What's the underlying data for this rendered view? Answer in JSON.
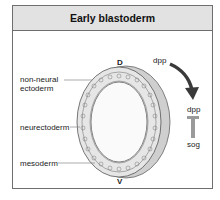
{
  "title": "Early blastoderm",
  "labels": {
    "non_neural_line1": "non-neural",
    "non_neural_line2": "ectoderm",
    "neurectoderm": "neurectoderm",
    "mesoderm": "mesoderm",
    "dorsal": "D",
    "ventral": "V",
    "arrow_label": "dpp",
    "inhibition_top": "dpp",
    "inhibition_bottom": "sog"
  },
  "colors": {
    "header_bg": "#e2e2e2",
    "frame": "#6e6e6e",
    "arrow": "#3a3a3a",
    "ring": "#d8d8d8"
  }
}
